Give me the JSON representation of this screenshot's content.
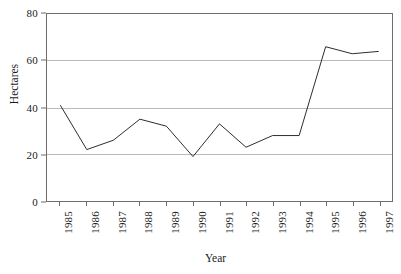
{
  "chart_data": {
    "type": "line",
    "title": "",
    "xlabel": "Year",
    "ylabel": "Hectares",
    "categories": [
      "1985",
      "1986",
      "1987",
      "1988",
      "1989",
      "1990",
      "1991",
      "1992",
      "1993",
      "1994",
      "1995",
      "1996",
      "1997"
    ],
    "values": [
      41,
      22,
      26,
      35,
      32,
      19,
      33,
      23,
      28,
      28,
      66,
      63,
      64
    ],
    "series": [
      {
        "name": "Hectares",
        "values": [
          41,
          22,
          26,
          35,
          32,
          19,
          33,
          23,
          28,
          28,
          66,
          63,
          64
        ]
      }
    ],
    "ylim": [
      0,
      80
    ],
    "yticks": [
      "0",
      "20",
      "40",
      "60",
      "80"
    ],
    "ytick_values": [
      0,
      20,
      40,
      60,
      80
    ],
    "grid": "horizontal",
    "legend": "none",
    "line_color": "#2b2b2b",
    "grid_color": "#b9b9b9",
    "axis_color": "#6e6e6e",
    "background_color": "#ffffff"
  },
  "axes": {
    "y_title": "Hectares",
    "x_title": "Year"
  }
}
